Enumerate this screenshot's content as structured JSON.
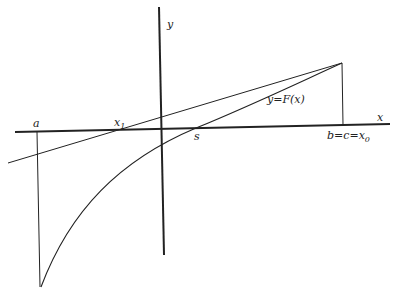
{
  "diagram": {
    "type": "secant-method-illustration",
    "axes": {
      "x_label": "x",
      "y_label": "y"
    },
    "curve_label": "y=F(x)",
    "points": {
      "a": "a",
      "x1": {
        "base": "x",
        "sub": "1"
      },
      "s": "s",
      "b_label": {
        "base": "b=c=x",
        "sub": "0"
      }
    },
    "colors": {
      "stroke": "#222222",
      "background": "#ffffff"
    }
  }
}
